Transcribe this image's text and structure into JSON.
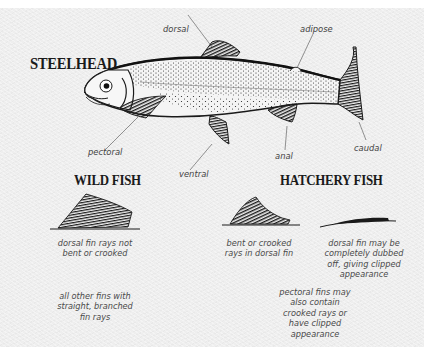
{
  "title": "STEELHEAD",
  "fin_labels": {
    "dorsal": "dorsal",
    "adipose": "adipose",
    "pectoral": "pectoral",
    "ventral": "ventral",
    "anal": "anal",
    "caudal": "caudal"
  },
  "wild": {
    "heading": "WILD FISH",
    "fin_note": "dorsal fin rays not\nbent or crooked",
    "other_note": "all other fins with\nstraight, branched\nfin rays"
  },
  "hatchery": {
    "heading": "HATCHERY FISH",
    "bent_note": "bent or crooked\nrays in dorsal fin",
    "clipped_note": "dorsal fin may be\ncompletely dubbed\noff, giving clipped\nappearance",
    "pectoral_note": "pectoral fins may\nalso contain\ncrooked rays or\nhave clipped\nappearance"
  },
  "colors": {
    "paper": "#eeeeee",
    "ink": "#1a1a1a",
    "label_text": "#444444"
  }
}
